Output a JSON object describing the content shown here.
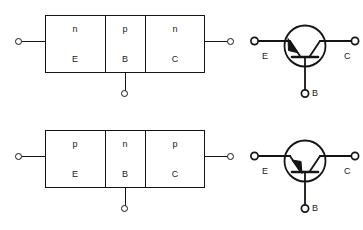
{
  "figure": {
    "background_color": "#ffffff",
    "line_color": "#141414"
  },
  "units": [
    {
      "id": "npn",
      "type_name": "NPN",
      "block_diagram": {
        "regions": [
          {
            "dopant": "n",
            "terminal": "E",
            "name": "emitter"
          },
          {
            "dopant": "p",
            "terminal": "B",
            "name": "base"
          },
          {
            "dopant": "n",
            "terminal": "C",
            "name": "collector"
          }
        ]
      },
      "symbol": {
        "labels": {
          "emitter": "E",
          "collector": "C",
          "base": "B"
        },
        "arrow_on": "emitter",
        "arrow_direction": "outward"
      }
    },
    {
      "id": "pnp",
      "type_name": "PNP",
      "block_diagram": {
        "regions": [
          {
            "dopant": "p",
            "terminal": "E",
            "name": "emitter"
          },
          {
            "dopant": "n",
            "terminal": "B",
            "name": "base"
          },
          {
            "dopant": "p",
            "terminal": "C",
            "name": "collector"
          }
        ]
      },
      "symbol": {
        "labels": {
          "emitter": "E",
          "collector": "C",
          "base": "B"
        },
        "arrow_on": "emitter",
        "arrow_direction": "inward"
      }
    }
  ]
}
